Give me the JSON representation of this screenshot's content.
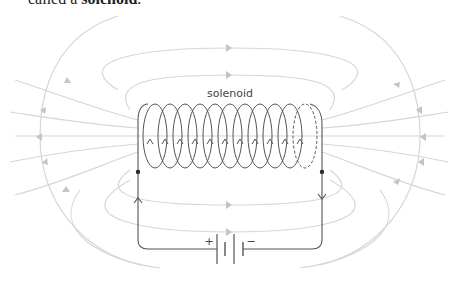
{
  "caption": {
    "prefix": "called a ",
    "term": "solenoid",
    "suffix": "."
  },
  "diagram": {
    "coil_label": "solenoid",
    "battery_plus": "+",
    "battery_minus": "−",
    "coil_turns": 11,
    "colors": {
      "wire": "#555555",
      "field_lines": "#d6d6d6",
      "field_arrows": "#c4c4c4"
    }
  }
}
